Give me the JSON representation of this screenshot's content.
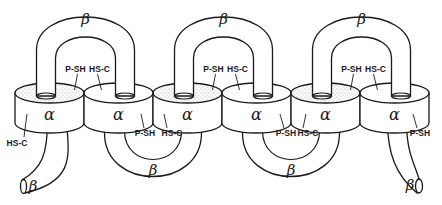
{
  "diagram": {
    "alpha_label": "α",
    "beta_label": "β",
    "alpha_discs": [
      {
        "label": "α",
        "top_stippled": true,
        "side_label": "HS-C",
        "side_label_pos": "left-bottom"
      },
      {
        "label": "α",
        "top_stippled": false,
        "side_label": "P-SH",
        "side_label_pos": "right-bottom"
      },
      {
        "label": "α",
        "top_stippled": true,
        "side_label": "HS-C",
        "side_label_pos": "left-bottom"
      },
      {
        "label": "α",
        "top_stippled": false,
        "side_label": "P-SH",
        "side_label_pos": "right-bottom"
      },
      {
        "label": "α",
        "top_stippled": true,
        "side_label": "HS-C",
        "side_label_pos": "left-bottom"
      },
      {
        "label": "α",
        "top_stippled": false,
        "side_label": "P-SH",
        "side_label_pos": "right-bottom"
      }
    ],
    "top_loops": [
      {
        "label": "β",
        "left_label": "P-SH",
        "right_label": "HS-C"
      },
      {
        "label": "β",
        "left_label": "P-SH",
        "right_label": "HS-C"
      },
      {
        "label": "β",
        "left_label": "P-SH",
        "right_label": "HS-C"
      }
    ],
    "bottom_loops": [
      {
        "label": "β"
      },
      {
        "label": "β"
      }
    ],
    "end_tails": [
      {
        "label": "β",
        "side": "left"
      },
      {
        "label": "β",
        "side": "right"
      }
    ],
    "labels": {
      "p_sh": "P-SH",
      "hs_c": "HS-C"
    }
  }
}
